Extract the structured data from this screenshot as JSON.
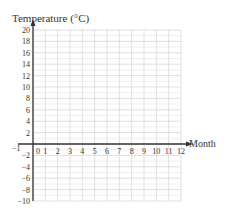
{
  "chart_data": {
    "type": "line",
    "title": "",
    "xlabel": "Month",
    "ylabel": "Temperature (°C)",
    "xlim": [
      0,
      12
    ],
    "ylim": [
      -10,
      20
    ],
    "x_ticks": [
      "0",
      "1",
      "2",
      "3",
      "4",
      "5",
      "6",
      "7",
      "8",
      "9",
      "10",
      "11",
      "12"
    ],
    "x_extra_label": "−1",
    "y_ticks": [
      "20",
      "18",
      "16",
      "14",
      "12",
      "10",
      "8",
      "6",
      "4",
      "2",
      "−2",
      "−4",
      "−6",
      "−8",
      "−10"
    ],
    "y_tick_values": [
      20,
      18,
      16,
      14,
      12,
      10,
      8,
      6,
      4,
      2,
      -2,
      -4,
      -6,
      -8,
      -10
    ],
    "grid": true,
    "series": [],
    "colors": {
      "axis": "#333333",
      "grid": "#d8d8d8",
      "text": "#333333"
    }
  }
}
